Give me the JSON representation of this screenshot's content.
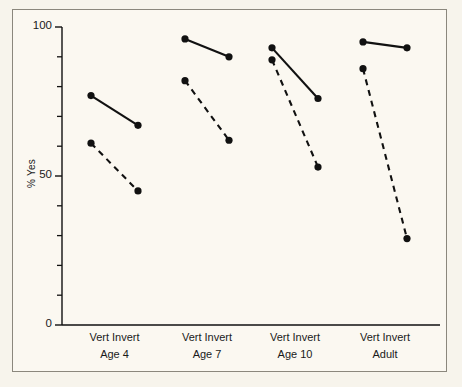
{
  "chart_data": {
    "type": "line",
    "title": "",
    "xlabel": "",
    "ylabel": "% Yes",
    "ylim": [
      0,
      100
    ],
    "yticks_major": [
      0,
      50,
      100
    ],
    "yticks_minor": [
      10,
      20,
      30,
      40,
      60,
      70,
      80,
      90
    ],
    "ytick_labels": [
      "0",
      "50",
      "100"
    ],
    "grid": false,
    "legend_position": "none",
    "categories": [
      "Vert",
      "Invert"
    ],
    "groups": [
      "Age 4",
      "Age 7",
      "Age 10",
      "Adult"
    ],
    "series": [
      {
        "name": "Upright (solid)",
        "style": "solid",
        "marker": "filled-circle",
        "color": "#111111",
        "values_by_group": {
          "Age 4": {
            "Vert": 77,
            "Invert": 67
          },
          "Age 7": {
            "Vert": 96,
            "Invert": 90
          },
          "Age 10": {
            "Vert": 93,
            "Invert": 76
          },
          "Adult": {
            "Vert": 95,
            "Invert": 93
          }
        }
      },
      {
        "name": "Inverted (dashed)",
        "style": "dashed",
        "marker": "filled-circle",
        "color": "#111111",
        "values_by_group": {
          "Age 4": {
            "Vert": 61,
            "Invert": 45
          },
          "Age 7": {
            "Vert": 82,
            "Invert": 62
          },
          "Age 10": {
            "Vert": 89,
            "Invert": 53
          },
          "Adult": {
            "Vert": 86,
            "Invert": 29
          }
        }
      }
    ]
  },
  "axis": {
    "y_label": "% Yes",
    "y_max_label": "100",
    "y_mid_label": "50",
    "y_min_label": "0"
  },
  "xaxis": {
    "groups": [
      {
        "conditions": "Vert  Invert",
        "name": "Age 4"
      },
      {
        "conditions": "Vert  Invert",
        "name": "Age 7"
      },
      {
        "conditions": "Vert  Invert",
        "name": "Age 10"
      },
      {
        "conditions": "Vert  Invert",
        "name": "Adult"
      }
    ]
  },
  "colors": {
    "ink": "#111111",
    "frame": "#8b877d",
    "background": "#fbf8f1"
  }
}
